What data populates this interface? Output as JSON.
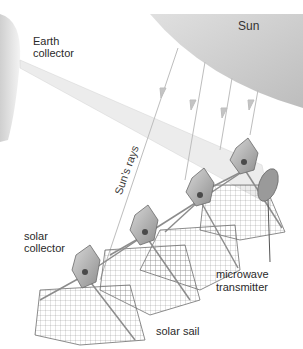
{
  "diagram": {
    "labels": {
      "sun": "Sun",
      "earth_collector_line1": "Earth",
      "earth_collector_line2": "collector",
      "suns_rays": "Sun’s rays",
      "solar_collector_line1": "solar",
      "solar_collector_line2": "collector",
      "microwave_transmitter_line1": "microwave",
      "microwave_transmitter_line2": "transmitter",
      "solar_sail": "solar sail"
    },
    "colors": {
      "sun_fill": "#c9c9c9",
      "earth_fill": "#d8d8d8",
      "beam": "#e6e6e6",
      "ray": "#bcbcbc",
      "structure": "#8a8a8a",
      "panel": "#b4b4b4"
    },
    "collector_count": 4
  }
}
